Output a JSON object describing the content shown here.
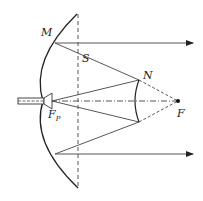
{
  "diagram": {
    "type": "cassegrain-antenna-optics",
    "labels": {
      "M": "M",
      "S": "S",
      "N": "N",
      "F": "F",
      "Fp_main": "F",
      "Fp_sub": "P"
    },
    "colors": {
      "line": "#333333",
      "ray": "#555555",
      "background": "#ffffff"
    }
  }
}
